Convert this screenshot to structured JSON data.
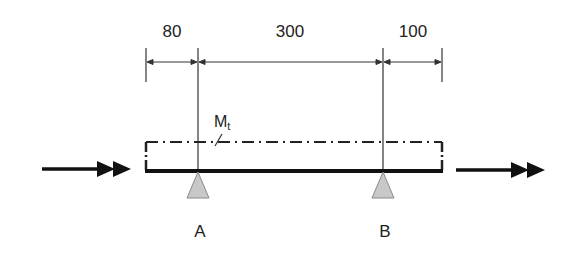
{
  "diagram": {
    "type": "beam-with-supports",
    "dimensions": [
      {
        "label": "80",
        "from": "left-end",
        "to": "A"
      },
      {
        "label": "300",
        "from": "A",
        "to": "B"
      },
      {
        "label": "100",
        "from": "B",
        "to": "right-end"
      }
    ],
    "torque_label": {
      "main": "M",
      "sub": "t"
    },
    "supports": [
      {
        "label": "A"
      },
      {
        "label": "B"
      }
    ],
    "arrows": [
      {
        "name": "input-force",
        "direction": "right",
        "style": "double-head"
      },
      {
        "name": "output-force",
        "direction": "right",
        "style": "double-head"
      }
    ],
    "colors": {
      "line": "#1a1a1a",
      "support_fill": "#c8c8c8",
      "support_stroke": "#8a8a8a",
      "text": "#222222"
    }
  }
}
